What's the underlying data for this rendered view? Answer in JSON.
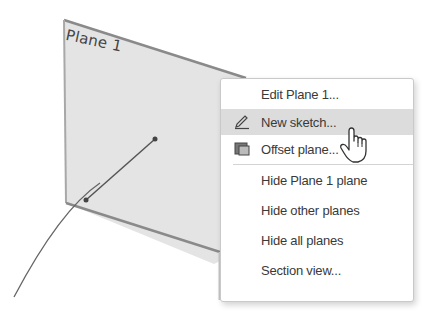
{
  "viewport": {
    "plane": {
      "name": "Plane 1",
      "fill_color": "#e4e4e4",
      "edge_color": "#8a8a8a"
    },
    "sketch": {
      "line_color": "#555555"
    }
  },
  "context_menu": {
    "items": [
      {
        "label": "Edit Plane 1...",
        "icon": null,
        "state": "normal"
      },
      {
        "label": "New sketch...",
        "icon": "pencil-icon",
        "state": "hover"
      },
      {
        "label": "Offset plane...",
        "icon": "offset-plane-icon",
        "state": "normal"
      },
      {
        "label": "Hide Plane 1 plane",
        "icon": null,
        "state": "normal"
      },
      {
        "label": "Hide other planes",
        "icon": null,
        "state": "normal"
      },
      {
        "label": "Hide all planes",
        "icon": null,
        "state": "normal"
      },
      {
        "label": "Section view...",
        "icon": null,
        "state": "normal"
      }
    ],
    "hover_color": "#dcdcdc"
  },
  "cursor": {
    "type": "hand-pointer-icon"
  }
}
